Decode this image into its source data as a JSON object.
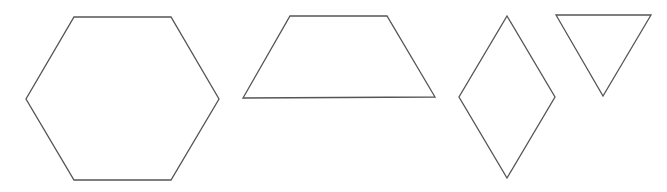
{
  "canvas": {
    "width": 667,
    "height": 192,
    "background": "#ffffff",
    "stroke_color": "#555555"
  },
  "shapes": [
    {
      "name": "hexagon",
      "points": [
        [
          74,
          17
        ],
        [
          171,
          17
        ],
        [
          219,
          99
        ],
        [
          171,
          180
        ],
        [
          74,
          180
        ],
        [
          26,
          99
        ]
      ]
    },
    {
      "name": "trapezoid",
      "points": [
        [
          290,
          16
        ],
        [
          387,
          16
        ],
        [
          435,
          97
        ],
        [
          243,
          98
        ]
      ]
    },
    {
      "name": "rhombus",
      "points": [
        [
          507,
          16
        ],
        [
          555,
          97
        ],
        [
          507,
          178
        ],
        [
          459,
          97
        ]
      ]
    },
    {
      "name": "triangle",
      "points": [
        [
          556,
          15
        ],
        [
          651,
          15
        ],
        [
          603,
          96
        ]
      ]
    }
  ]
}
